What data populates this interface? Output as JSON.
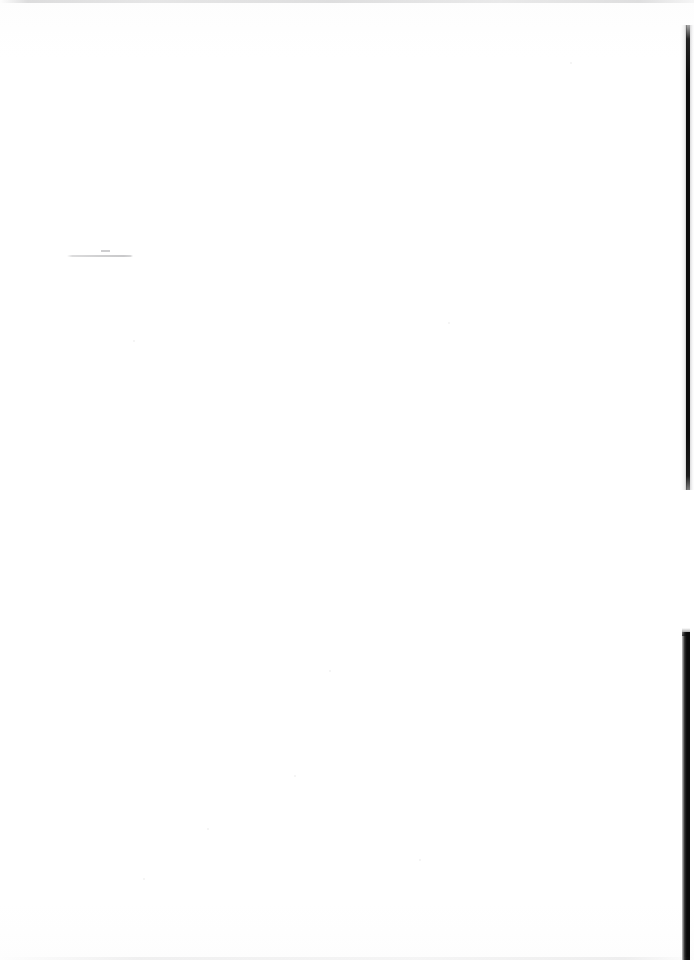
{
  "document": {
    "kind": "scanned-page",
    "title": "Blank scanned page",
    "page_width": 694,
    "page_height": 960,
    "background_color": "#fefefe",
    "text_content": "",
    "visible_text_count": 0,
    "note": "No legible text, headings, figures or page numbers are rendered on this page."
  },
  "artifacts": {
    "top_scan_line": {
      "name": "top-edge-scan-line",
      "color": "#96969a",
      "x": 0,
      "y": 0,
      "width": 694,
      "height": 3
    },
    "bottom_scan_line": {
      "name": "bottom-edge-scan-line",
      "color": "#aaaaac",
      "x": 0,
      "y": 957,
      "width": 694,
      "height": 3
    },
    "pencil_rule": {
      "name": "faint-horizontal-rule",
      "color": "#78787c",
      "x": 67,
      "y": 255,
      "width": 66,
      "height": 2
    },
    "pencil_dash": {
      "name": "faint-dash-mark",
      "color": "#78787c",
      "x": 101,
      "y": 250,
      "width": 9,
      "height": 2
    },
    "edge_shadow_upper": {
      "name": "right-edge-shadow-upper",
      "color": "#0c0c0c",
      "x": 686,
      "y": 25,
      "width": 4,
      "height": 465
    },
    "edge_shadow_lower": {
      "name": "right-edge-shadow-lower",
      "color": "#090909",
      "x": 682,
      "y": 632,
      "width": 8,
      "height": 328
    },
    "edge_highlight": {
      "name": "right-edge-paper-highlight",
      "color": "#bebec0",
      "x": 690,
      "y": 25,
      "width": 4,
      "height": 465
    },
    "specks": [
      {
        "x": 448,
        "y": 322,
        "size": 2
      },
      {
        "x": 133,
        "y": 340,
        "size": 2
      },
      {
        "x": 330,
        "y": 988,
        "size": 2
      },
      {
        "x": 329,
        "y": 670,
        "size": 2
      },
      {
        "x": 294,
        "y": 775,
        "size": 2
      },
      {
        "x": 207,
        "y": 828,
        "size": 2
      },
      {
        "x": 143,
        "y": 878,
        "size": 2
      },
      {
        "x": 419,
        "y": 859,
        "size": 2
      },
      {
        "x": 570,
        "y": 62,
        "size": 2
      }
    ]
  }
}
